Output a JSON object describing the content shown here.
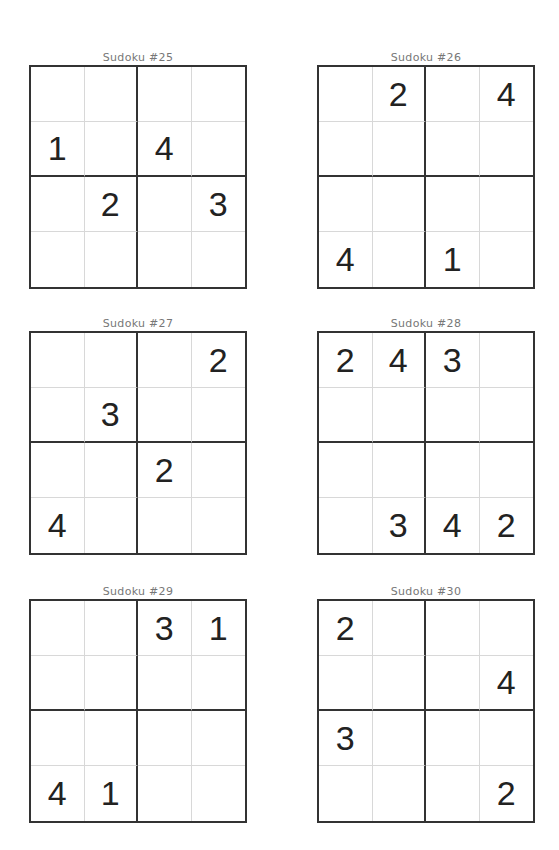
{
  "puzzles": [
    {
      "title": "Sudoku #25",
      "grid": [
        [
          "",
          "",
          "",
          ""
        ],
        [
          "1",
          "",
          "4",
          ""
        ],
        [
          "",
          "2",
          "",
          "3"
        ],
        [
          "",
          "",
          "",
          ""
        ]
      ]
    },
    {
      "title": "Sudoku #26",
      "grid": [
        [
          "",
          "2",
          "",
          "4"
        ],
        [
          "",
          "",
          "",
          ""
        ],
        [
          "",
          "",
          "",
          ""
        ],
        [
          "4",
          "",
          "1",
          ""
        ]
      ]
    },
    {
      "title": "Sudoku #27",
      "grid": [
        [
          "",
          "",
          "",
          "2"
        ],
        [
          "",
          "3",
          "",
          ""
        ],
        [
          "",
          "",
          "2",
          ""
        ],
        [
          "4",
          "",
          "",
          ""
        ]
      ]
    },
    {
      "title": "Sudoku #28",
      "grid": [
        [
          "2",
          "4",
          "3",
          ""
        ],
        [
          "",
          "",
          "",
          ""
        ],
        [
          "",
          "",
          "",
          ""
        ],
        [
          "",
          "3",
          "4",
          "2"
        ]
      ]
    },
    {
      "title": "Sudoku #29",
      "grid": [
        [
          "",
          "",
          "3",
          "1"
        ],
        [
          "",
          "",
          "",
          ""
        ],
        [
          "",
          "",
          "",
          ""
        ],
        [
          "4",
          "1",
          "",
          ""
        ]
      ]
    },
    {
      "title": "Sudoku #30",
      "grid": [
        [
          "2",
          "",
          "",
          ""
        ],
        [
          "",
          "",
          "",
          "4"
        ],
        [
          "3",
          "",
          "",
          ""
        ],
        [
          "",
          "",
          "",
          "2"
        ]
      ]
    }
  ]
}
